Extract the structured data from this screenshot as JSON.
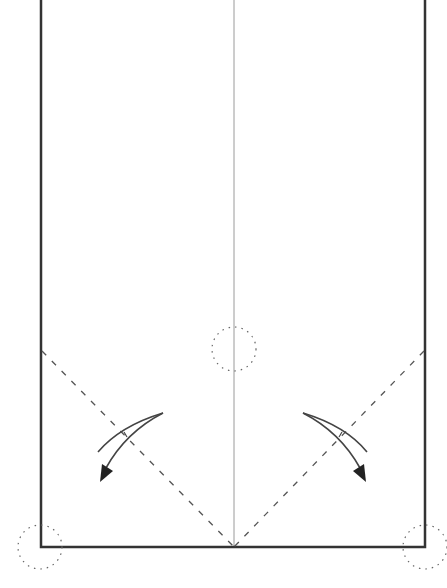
{
  "diagram": {
    "type": "origami-fold-step",
    "paper": {
      "left": 41,
      "right": 425,
      "top": 0,
      "bottom": 547,
      "edge_color": "#333333"
    },
    "center_crease": {
      "x": 234,
      "color": "#999999"
    },
    "valley_folds": [
      {
        "from": [
          42,
          351
        ],
        "to": [
          234,
          547
        ]
      },
      {
        "from": [
          424,
          351
        ],
        "to": [
          234,
          547
        ]
      }
    ],
    "reference_circles": [
      {
        "cx": 234,
        "cy": 349,
        "r": 22
      },
      {
        "cx": 40,
        "cy": 547,
        "r": 22
      },
      {
        "cx": 425,
        "cy": 547,
        "r": 22
      }
    ],
    "fold_arrows": [
      {
        "side": "left",
        "direction": "down-left"
      },
      {
        "side": "right",
        "direction": "down-right"
      }
    ],
    "line_color": "#444444"
  }
}
